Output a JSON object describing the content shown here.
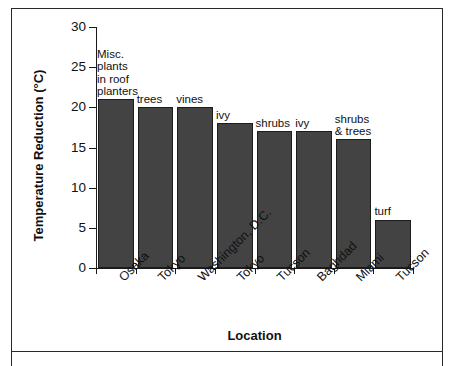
{
  "chart_data": {
    "type": "bar",
    "title": "",
    "xlabel": "Location",
    "ylabel": "Temperature Reduction (°C)",
    "ylim": [
      0,
      30
    ],
    "yticks": [
      0,
      5,
      10,
      15,
      20,
      25,
      30
    ],
    "grid": false,
    "legend": "none",
    "categories": [
      "Osaka",
      "Tokyo",
      "Washington, D.C.",
      "Tokyo",
      "Tucson",
      "Baghdad",
      "Miami",
      "Tucson"
    ],
    "values": [
      21,
      20,
      20,
      18,
      17,
      17,
      16,
      6
    ],
    "bar_annotations": [
      "Misc.\nplants\nin roof\nplanters",
      "trees",
      "vines",
      "ivy",
      "shrubs",
      "ivy",
      "shrubs\n& trees",
      "turf"
    ],
    "bar_color": "#434343",
    "bar_edge_color": "#1c1c1c",
    "axis_color": "#1a1a1a"
  },
  "axes": {
    "y_title": "Temperature Reduction (°C)",
    "x_title": "Location",
    "y_tick_labels": [
      "0",
      "5",
      "10",
      "15",
      "20",
      "25",
      "30"
    ]
  }
}
